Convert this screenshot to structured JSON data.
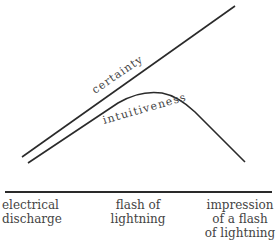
{
  "diagram": {
    "curves": [
      {
        "name": "certainty",
        "label": "certainty",
        "shape": "straight line rising"
      },
      {
        "name": "intuitiveness",
        "label": "intuitiveness",
        "shape": "rises then peaks and falls"
      }
    ],
    "axis_labels": [
      {
        "line1": "electrical",
        "line2": "discharge",
        "line3": ""
      },
      {
        "line1": "flash of",
        "line2": "lightning",
        "line3": ""
      },
      {
        "line1": "impression",
        "line2": "of a flash",
        "line3": "of lightning"
      }
    ],
    "colors": {
      "line": "#2a2a2a",
      "text": "#444444"
    }
  }
}
